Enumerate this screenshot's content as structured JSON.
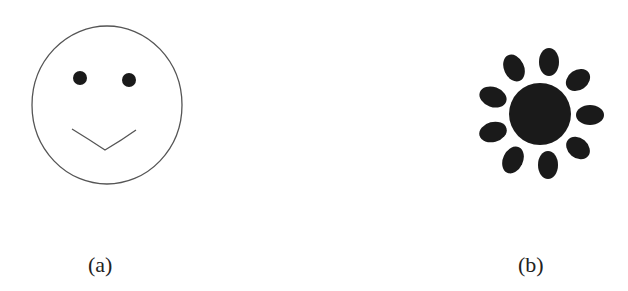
{
  "figures": [
    {
      "id": "a",
      "caption": "(a)",
      "description": "smiley face outline",
      "stroke_color": "#555555",
      "fill_color": "#1a1a1a"
    },
    {
      "id": "b",
      "caption": "(b)",
      "description": "filled flower / sun shape with petals",
      "petal_count": 9,
      "fill_color": "#1a1a1a"
    }
  ]
}
